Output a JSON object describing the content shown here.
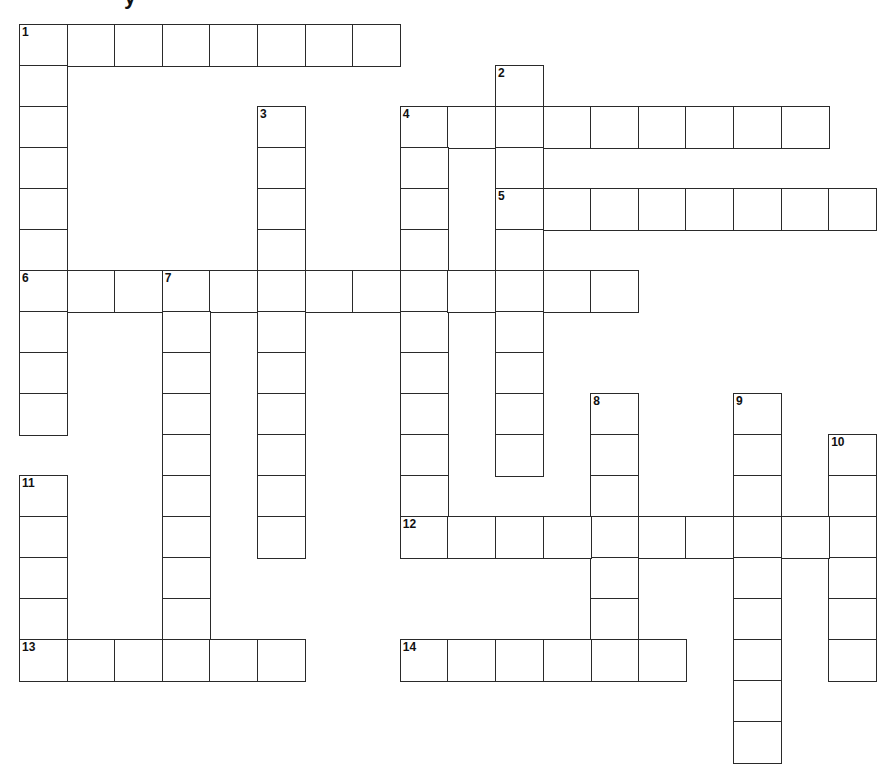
{
  "puzzle": {
    "title_fragment": "y",
    "grid": {
      "origin_x": 19,
      "origin_y": 24,
      "cell_w": 47.6,
      "cell_h": 41,
      "line_color": "#2a2a2a",
      "background": "#ffffff"
    },
    "words": [
      {
        "number": 1,
        "direction": "across",
        "row": 0,
        "col": 0,
        "length": 8
      },
      {
        "number": 1,
        "direction": "down",
        "row": 0,
        "col": 0,
        "length": 10
      },
      {
        "number": 2,
        "direction": "down",
        "row": 1,
        "col": 10,
        "length": 10
      },
      {
        "number": 3,
        "direction": "down",
        "row": 2,
        "col": 5,
        "length": 11
      },
      {
        "number": 4,
        "direction": "across",
        "row": 2,
        "col": 8,
        "length": 9
      },
      {
        "number": 4,
        "direction": "down",
        "row": 2,
        "col": 8,
        "length": 11
      },
      {
        "number": 5,
        "direction": "across",
        "row": 4,
        "col": 10,
        "length": 8
      },
      {
        "number": 6,
        "direction": "across",
        "row": 6,
        "col": 0,
        "length": 13
      },
      {
        "number": 7,
        "direction": "down",
        "row": 6,
        "col": 3,
        "length": 10
      },
      {
        "number": 8,
        "direction": "down",
        "row": 9,
        "col": 12,
        "length": 7
      },
      {
        "number": 9,
        "direction": "down",
        "row": 9,
        "col": 15,
        "length": 9
      },
      {
        "number": 10,
        "direction": "down",
        "row": 10,
        "col": 17,
        "length": 6
      },
      {
        "number": 11,
        "direction": "down",
        "row": 11,
        "col": 0,
        "length": 5
      },
      {
        "number": 12,
        "direction": "across",
        "row": 12,
        "col": 8,
        "length": 10
      },
      {
        "number": 13,
        "direction": "across",
        "row": 15,
        "col": 0,
        "length": 6
      },
      {
        "number": 14,
        "direction": "across",
        "row": 15,
        "col": 8,
        "length": 6
      }
    ],
    "numbers": [
      {
        "label": "1",
        "row": 0,
        "col": 0
      },
      {
        "label": "2",
        "row": 1,
        "col": 10
      },
      {
        "label": "3",
        "row": 2,
        "col": 5
      },
      {
        "label": "4",
        "row": 2,
        "col": 8
      },
      {
        "label": "5",
        "row": 4,
        "col": 10
      },
      {
        "label": "6",
        "row": 6,
        "col": 0
      },
      {
        "label": "7",
        "row": 6,
        "col": 3
      },
      {
        "label": "8",
        "row": 9,
        "col": 12
      },
      {
        "label": "9",
        "row": 9,
        "col": 15
      },
      {
        "label": "10",
        "row": 10,
        "col": 17
      },
      {
        "label": "11",
        "row": 11,
        "col": 0
      },
      {
        "label": "12",
        "row": 12,
        "col": 8
      },
      {
        "label": "13",
        "row": 15,
        "col": 0
      },
      {
        "label": "14",
        "row": 15,
        "col": 8
      }
    ]
  }
}
